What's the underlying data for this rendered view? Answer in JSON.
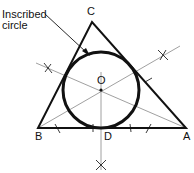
{
  "diagram": {
    "callout": {
      "line1": "Inscribed",
      "line2": "circle"
    },
    "vertices": {
      "a": "A",
      "b": "B",
      "c": "C"
    },
    "points": {
      "center": "O",
      "tangent": "D"
    },
    "colors": {
      "ink": "#111111",
      "construction": "#777777"
    }
  }
}
